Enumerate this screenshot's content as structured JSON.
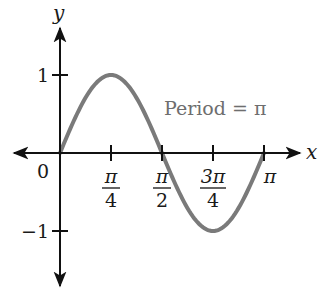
{
  "chart_data": {
    "type": "line",
    "title": "",
    "function": "y = sin(2x)",
    "xlabel": "x",
    "ylabel": "y",
    "annotation": "Period = π",
    "x_tick_labels": [
      {
        "num": "π",
        "den": "4",
        "value": 0.7854
      },
      {
        "num": "π",
        "den": "2",
        "value": 1.5708
      },
      {
        "num": "3π",
        "den": "4",
        "value": 2.3562
      },
      {
        "num": "π",
        "den": "",
        "value": 3.1416
      }
    ],
    "origin_label": "0",
    "y_tick_labels": [
      {
        "label": "1",
        "value": 1
      },
      {
        "label": "−1",
        "value": -1
      }
    ],
    "series": [
      {
        "name": "sin(2x)",
        "color": "#7a7a7a",
        "x": [
          0,
          0.3927,
          0.7854,
          1.1781,
          1.5708,
          1.9635,
          2.3562,
          2.7489,
          3.1416
        ],
        "y": [
          0,
          0.7071,
          1,
          0.7071,
          0,
          -0.7071,
          -1,
          -0.7071,
          0
        ]
      }
    ],
    "xlim": [
      -0.85,
      3.65
    ],
    "ylim": [
      -1.6,
      1.6
    ],
    "grid": false,
    "legend": "none",
    "axis_color": "#111111"
  }
}
